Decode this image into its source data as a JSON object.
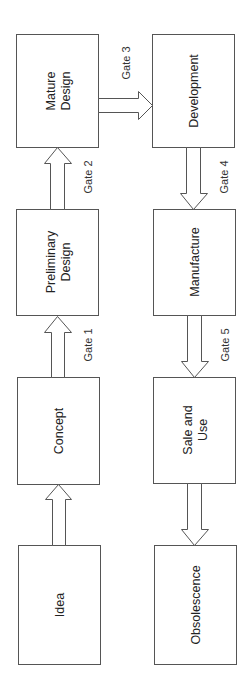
{
  "diagram": {
    "type": "product-lifecycle-flow",
    "stages": [
      {
        "id": "idea",
        "lines": [
          "Idea"
        ]
      },
      {
        "id": "concept",
        "lines": [
          "Concept"
        ]
      },
      {
        "id": "preliminary-design",
        "lines": [
          "Preliminary",
          "Design"
        ]
      },
      {
        "id": "mature-design",
        "lines": [
          "Mature",
          "Design"
        ]
      },
      {
        "id": "development",
        "lines": [
          "Development"
        ]
      },
      {
        "id": "manufacture",
        "lines": [
          "Manufacture"
        ]
      },
      {
        "id": "sale-and-use",
        "lines": [
          "Sale and",
          "Use"
        ]
      },
      {
        "id": "obsolescence",
        "lines": [
          "Obsolescence"
        ]
      }
    ],
    "connections": [
      {
        "from": "idea",
        "to": "concept",
        "gate": ""
      },
      {
        "from": "concept",
        "to": "preliminary-design",
        "gate": "Gate 1"
      },
      {
        "from": "preliminary-design",
        "to": "mature-design",
        "gate": "Gate 2"
      },
      {
        "from": "mature-design",
        "to": "development",
        "gate": "Gate 3"
      },
      {
        "from": "development",
        "to": "manufacture",
        "gate": "Gate 4"
      },
      {
        "from": "manufacture",
        "to": "sale-and-use",
        "gate": "Gate 5"
      },
      {
        "from": "sale-and-use",
        "to": "obsolescence",
        "gate": ""
      }
    ]
  }
}
